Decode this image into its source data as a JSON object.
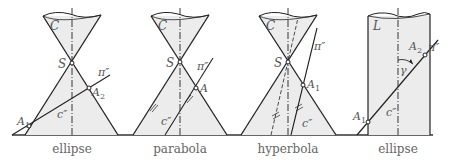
{
  "figure": {
    "panels": [
      {
        "caption": "ellipse",
        "surface_label": "C",
        "apex_label": "S",
        "plane_label": "π''",
        "curve_label": "c''",
        "points": [
          "A1",
          "A2"
        ]
      },
      {
        "caption": "parabola",
        "surface_label": "C",
        "apex_label": "S",
        "plane_label": "π''",
        "curve_label": "c''",
        "points": [
          "A"
        ]
      },
      {
        "caption": "hyperbola",
        "surface_label": "C",
        "apex_label": "S",
        "plane_label": "π''",
        "curve_label": "c''",
        "points": [
          "A1"
        ]
      },
      {
        "caption": "ellipse",
        "surface_label": "L",
        "plane_label": "π''",
        "curve_label": "c''",
        "angle_label": "γ",
        "points": [
          "A1",
          "A2"
        ]
      }
    ]
  },
  "labels": {
    "p1": {
      "caption": "ellipse",
      "C": "C",
      "S": "S",
      "pi": "π″",
      "c": "c″",
      "A1": "A",
      "A1sub": "1",
      "A2": "A",
      "A2sub": "2"
    },
    "p2": {
      "caption": "parabola",
      "C": "C",
      "S": "S",
      "pi": "π″",
      "c": "c″",
      "A": "A"
    },
    "p3": {
      "caption": "hyperbola",
      "C": "C",
      "S": "S",
      "pi": "π″",
      "c": "c″",
      "A1": "A",
      "A1sub": "1"
    },
    "p4": {
      "caption": "ellipse",
      "L": "L",
      "pi": "π″",
      "c": "c″",
      "gamma": "γ",
      "A1": "A",
      "A1sub": "1",
      "A2": "A",
      "A2sub": "2"
    }
  },
  "colors": {
    "line": "#222222",
    "fill": "#ececec",
    "ground": "#555555",
    "text": "#555555"
  }
}
